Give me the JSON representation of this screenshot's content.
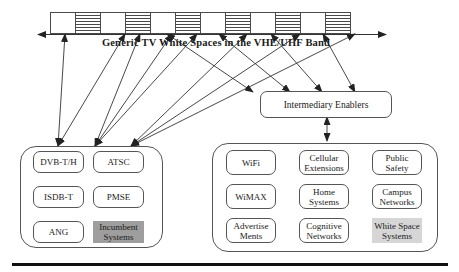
{
  "title": "Generic TV White Spaces in the VHE/UHF Band",
  "band": {
    "channels": [
      "white",
      "occupied",
      "white",
      "occupied",
      "white",
      "occupied",
      "white",
      "occupied",
      "white",
      "occupied",
      "white",
      "occupied"
    ],
    "axis": {
      "x1": 38,
      "y1": 34.5,
      "x2": 386,
      "y2": 34.5
    }
  },
  "intermediary": {
    "label": "Intermediary Enablers"
  },
  "incumbent_group": {
    "items": [
      {
        "label": "DVB-T/H",
        "variant": "outlined"
      },
      {
        "label": "ATSC",
        "variant": "outlined"
      },
      {
        "label": "ISDB-T",
        "variant": "outlined"
      },
      {
        "label": "PMSE",
        "variant": "outlined"
      },
      {
        "label": "ANG",
        "variant": "outlined"
      },
      {
        "label": "Incumbent Systems",
        "variant": "filled-dark"
      }
    ]
  },
  "whitespace_group": {
    "items": [
      {
        "label": "WiFi",
        "variant": "outlined"
      },
      {
        "label": "Cellular Extensions",
        "variant": "outlined"
      },
      {
        "label": "Public Safety",
        "variant": "outlined"
      },
      {
        "label": "WiMAX",
        "variant": "outlined"
      },
      {
        "label": "Home Systems",
        "variant": "outlined"
      },
      {
        "label": "Campus Networks",
        "variant": "outlined"
      },
      {
        "label": "Advertise Ments",
        "variant": "outlined"
      },
      {
        "label": "Cognitive Networks",
        "variant": "outlined"
      },
      {
        "label": "White Space Systems",
        "variant": "filled-light"
      }
    ]
  },
  "connections": {
    "incumbent_to_band": [
      {
        "x1": 58,
        "y1": 146,
        "x2": 65,
        "y2": 34
      },
      {
        "x1": 58,
        "y1": 146,
        "x2": 125,
        "y2": 34
      },
      {
        "x1": 95,
        "y1": 146,
        "x2": 140,
        "y2": 34
      },
      {
        "x1": 95,
        "y1": 146,
        "x2": 172,
        "y2": 34
      },
      {
        "x1": 95,
        "y1": 146,
        "x2": 197,
        "y2": 34
      },
      {
        "x1": 131,
        "y1": 146,
        "x2": 247,
        "y2": 34
      },
      {
        "x1": 131,
        "y1": 146,
        "x2": 300,
        "y2": 34
      },
      {
        "x1": 131,
        "y1": 146,
        "x2": 355,
        "y2": 34
      }
    ],
    "enabler_to_band": [
      {
        "x1": 253,
        "y1": 92,
        "x2": 167,
        "y2": 34
      },
      {
        "x1": 290,
        "y1": 92,
        "x2": 219,
        "y2": 34
      },
      {
        "x1": 322,
        "y1": 92,
        "x2": 271,
        "y2": 34
      },
      {
        "x1": 355,
        "y1": 92,
        "x2": 323,
        "y2": 34
      }
    ],
    "enabler_to_whitespace_group": {
      "x1": 327,
      "y1": 117,
      "x2": 327,
      "y2": 141
    }
  },
  "colors": {
    "line": "#333333",
    "node_border": "#555555",
    "incumbent_fill": "#9e9e9e",
    "whitespace_fill": "#d6d6d6",
    "rule": "#111111"
  }
}
